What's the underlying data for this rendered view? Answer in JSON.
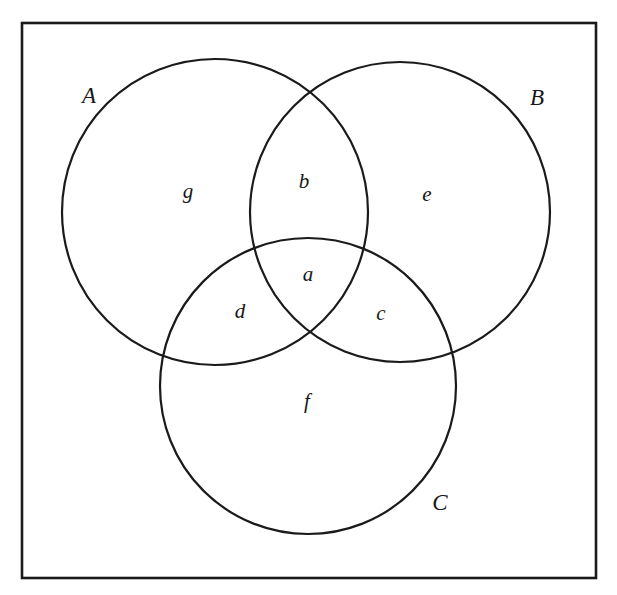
{
  "figure": {
    "name": "three-set-venn-diagram",
    "width": 617,
    "height": 595,
    "background_color": "#ffffff",
    "stroke_color": "#1a1a1a"
  },
  "universe": {
    "name": "universal-set-rectangle",
    "x": 22,
    "y": 23,
    "width": 574,
    "height": 555,
    "stroke_width": 2.6
  },
  "chart_data": {
    "type": "diagram",
    "subtype": "venn",
    "title": "",
    "set_count": 3,
    "sets": [
      {
        "key": "A",
        "label": "A",
        "cx": 215,
        "cy": 212,
        "r": 153,
        "label_x": 89,
        "label_y": 98
      },
      {
        "key": "B",
        "label": "B",
        "cx": 400,
        "cy": 212,
        "r": 150,
        "label_x": 537,
        "label_y": 100
      },
      {
        "key": "C",
        "label": "C",
        "cx": 308,
        "cy": 386,
        "r": 148,
        "label_x": 440,
        "label_y": 505
      }
    ],
    "regions": [
      {
        "key": "a",
        "label": "a",
        "membership": "A and B and C",
        "x": 308,
        "y": 276
      },
      {
        "key": "b",
        "label": "b",
        "membership": "A and B only",
        "x": 304,
        "y": 183
      },
      {
        "key": "c",
        "label": "c",
        "membership": "B and C only",
        "x": 381,
        "y": 315
      },
      {
        "key": "d",
        "label": "d",
        "membership": "A and C only",
        "x": 240,
        "y": 313
      },
      {
        "key": "e",
        "label": "e",
        "membership": "B only",
        "x": 427,
        "y": 196
      },
      {
        "key": "f",
        "label": "f",
        "membership": "C only",
        "x": 307,
        "y": 403
      },
      {
        "key": "g",
        "label": "g",
        "membership": "A only",
        "x": 188,
        "y": 193
      }
    ],
    "legend": null,
    "grid": false
  }
}
